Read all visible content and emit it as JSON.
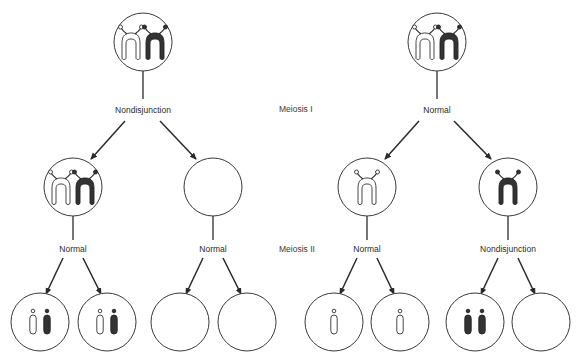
{
  "stage_labels": {
    "meiosis_1": "Meiosis I",
    "meiosis_2": "Meiosis II"
  },
  "left_panel": {
    "meiosis_1_event": "Nondisjunction",
    "meiosis_2_events": [
      "Normal",
      "Normal"
    ],
    "parent_cell_contents": [
      "light-homolog",
      "dark-homolog"
    ],
    "meiosis_1_daughters": [
      {
        "contents": [
          "light-homolog",
          "dark-homolog"
        ]
      },
      {
        "contents": []
      }
    ],
    "gametes": [
      {
        "contents": [
          "light-chromatid",
          "dark-chromatid"
        ]
      },
      {
        "contents": [
          "light-chromatid",
          "dark-chromatid"
        ]
      },
      {
        "contents": []
      },
      {
        "contents": []
      }
    ]
  },
  "right_panel": {
    "meiosis_1_event": "Normal",
    "meiosis_2_events": [
      "Normal",
      "Nondisjunction"
    ],
    "parent_cell_contents": [
      "light-homolog",
      "dark-homolog"
    ],
    "meiosis_1_daughters": [
      {
        "contents": [
          "light-homolog"
        ]
      },
      {
        "contents": [
          "dark-homolog"
        ]
      }
    ],
    "gametes": [
      {
        "contents": [
          "light-chromatid"
        ]
      },
      {
        "contents": [
          "light-chromatid"
        ]
      },
      {
        "contents": [
          "dark-chromatid",
          "dark-chromatid"
        ]
      },
      {
        "contents": []
      }
    ]
  },
  "colors": {
    "light_chromosome": "#ffffff",
    "dark_chromosome": "#333333",
    "outline": "#3a3a3a"
  }
}
